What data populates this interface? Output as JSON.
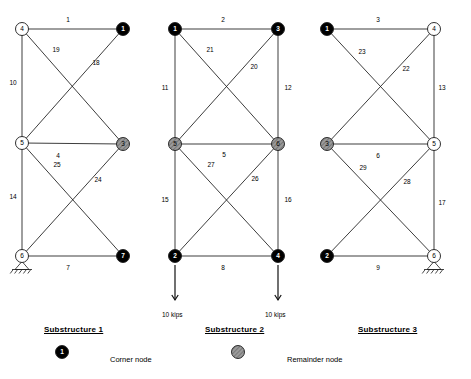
{
  "figure": {
    "title_caption_style": "underlined-bold",
    "node_radius": 6.5,
    "colors": {
      "corner_node_fill": "#000000",
      "remainder_node_fill": "#9a9a9a",
      "plain_node_fill": "#ffffff",
      "member_stroke": "#1a1a1a",
      "text": "#000000"
    }
  },
  "substructures": [
    {
      "caption": "Substructure 1",
      "caption_x": 44,
      "caption_y": 325,
      "nodes": [
        {
          "id": "4",
          "type": "plain",
          "x": 22,
          "y": 29
        },
        {
          "id": "1",
          "type": "corner",
          "x": 123,
          "y": 29
        },
        {
          "id": "5",
          "type": "plain",
          "x": 22,
          "y": 143
        },
        {
          "id": "3",
          "type": "remainder",
          "x": 123,
          "y": 144
        },
        {
          "id": "6",
          "type": "plain",
          "x": 22,
          "y": 256
        },
        {
          "id": "7",
          "type": "corner",
          "x": 123,
          "y": 256
        }
      ],
      "members": [
        {
          "label": "1",
          "from": "4",
          "to": "1",
          "lx": 68,
          "ly": 22
        },
        {
          "label": "19",
          "from": "4",
          "to": "3",
          "lx": 56,
          "ly": 52
        },
        {
          "label": "18",
          "from": "1",
          "to": "5",
          "lx": 96,
          "ly": 65
        },
        {
          "label": "10",
          "from": "4",
          "to": "5",
          "lx": 13,
          "ly": 85
        },
        {
          "label": "4",
          "from": "5",
          "to": "3",
          "lx": 58,
          "ly": 158
        },
        {
          "label": "25",
          "from": "5",
          "to": "7",
          "lx": 57,
          "ly": 167
        },
        {
          "label": "24",
          "from": "3",
          "to": "6",
          "lx": 98,
          "ly": 182
        },
        {
          "label": "14",
          "from": "5",
          "to": "6",
          "lx": 13,
          "ly": 199
        },
        {
          "label": "7",
          "from": "6",
          "to": "7",
          "lx": 68,
          "ly": 270
        }
      ],
      "supports": [
        {
          "node": "6",
          "kind": "pin-hatched"
        }
      ],
      "loads": []
    },
    {
      "caption": "Substructure 2",
      "caption_x": 205,
      "caption_y": 325,
      "nodes": [
        {
          "id": "1",
          "type": "corner",
          "x": 175,
          "y": 29
        },
        {
          "id": "3",
          "type": "corner",
          "x": 278,
          "y": 29
        },
        {
          "id": "5",
          "type": "remainder",
          "x": 175,
          "y": 144
        },
        {
          "id": "6",
          "type": "remainder",
          "x": 278,
          "y": 144
        },
        {
          "id": "2",
          "type": "corner",
          "x": 175,
          "y": 256
        },
        {
          "id": "4",
          "type": "corner",
          "x": 278,
          "y": 256
        }
      ],
      "members": [
        {
          "label": "2",
          "from": "1",
          "to": "3",
          "lx": 223,
          "ly": 22
        },
        {
          "label": "21",
          "from": "1",
          "to": "6",
          "lx": 210,
          "ly": 52
        },
        {
          "label": "20",
          "from": "3",
          "to": "5",
          "lx": 254,
          "ly": 69
        },
        {
          "label": "11",
          "from": "1",
          "to": "5",
          "lx": 165,
          "ly": 90
        },
        {
          "label": "12",
          "from": "3",
          "to": "6",
          "lx": 288,
          "ly": 90
        },
        {
          "label": "5",
          "from": "5",
          "to": "6",
          "lx": 224,
          "ly": 157
        },
        {
          "label": "27",
          "from": "5",
          "to": "4",
          "lx": 211,
          "ly": 167
        },
        {
          "label": "26",
          "from": "6",
          "to": "2",
          "lx": 255,
          "ly": 181
        },
        {
          "label": "15",
          "from": "5",
          "to": "2",
          "lx": 165,
          "ly": 202
        },
        {
          "label": "16",
          "from": "6",
          "to": "4",
          "lx": 288,
          "ly": 202
        },
        {
          "label": "8",
          "from": "2",
          "to": "4",
          "lx": 223,
          "ly": 270
        }
      ],
      "supports": [],
      "loads": [
        {
          "node": "2",
          "text": "10 kips",
          "x": 175,
          "y1": 265,
          "y2": 300,
          "tx": 162,
          "ty": 311
        },
        {
          "node": "4",
          "text": "10 kips",
          "x": 278,
          "y1": 265,
          "y2": 300,
          "tx": 265,
          "ty": 311
        }
      ]
    },
    {
      "caption": "Substructure 3",
      "caption_x": 358,
      "caption_y": 325,
      "nodes": [
        {
          "id": "1",
          "type": "corner",
          "x": 327,
          "y": 29
        },
        {
          "id": "4",
          "type": "plain",
          "x": 434,
          "y": 29
        },
        {
          "id": "3",
          "type": "remainder",
          "x": 327,
          "y": 144
        },
        {
          "id": "5",
          "type": "plain",
          "x": 434,
          "y": 144
        },
        {
          "id": "2",
          "type": "corner",
          "x": 327,
          "y": 256
        },
        {
          "id": "6",
          "type": "plain",
          "x": 434,
          "y": 256
        }
      ],
      "members": [
        {
          "label": "3",
          "from": "1",
          "to": "4",
          "lx": 378,
          "ly": 22
        },
        {
          "label": "23",
          "from": "1",
          "to": "5",
          "lx": 362,
          "ly": 54
        },
        {
          "label": "22",
          "from": "4",
          "to": "3",
          "lx": 406,
          "ly": 71
        },
        {
          "label": "13",
          "from": "4",
          "to": "5",
          "lx": 442,
          "ly": 90
        },
        {
          "label": "6",
          "from": "3",
          "to": "5",
          "lx": 378,
          "ly": 158
        },
        {
          "label": "29",
          "from": "3",
          "to": "6",
          "lx": 363,
          "ly": 170
        },
        {
          "label": "28",
          "from": "5",
          "to": "2",
          "lx": 407,
          "ly": 184
        },
        {
          "label": "17",
          "from": "5",
          "to": "6",
          "lx": 442,
          "ly": 205
        },
        {
          "label": "9",
          "from": "2",
          "to": "6",
          "lx": 378,
          "ly": 270
        }
      ],
      "supports": [
        {
          "node": "6",
          "kind": "roller-hatched"
        }
      ],
      "loads": []
    }
  ],
  "legend": [
    {
      "symbol": "corner-node-symbol",
      "node_label": "1",
      "text": "Corner node",
      "sx": 62,
      "sy": 352,
      "tx": 110,
      "ty": 355
    },
    {
      "symbol": "remainder-node-symbol",
      "node_label": "",
      "text": "Remainder node",
      "sx": 238,
      "sy": 352,
      "tx": 287,
      "ty": 355
    }
  ]
}
